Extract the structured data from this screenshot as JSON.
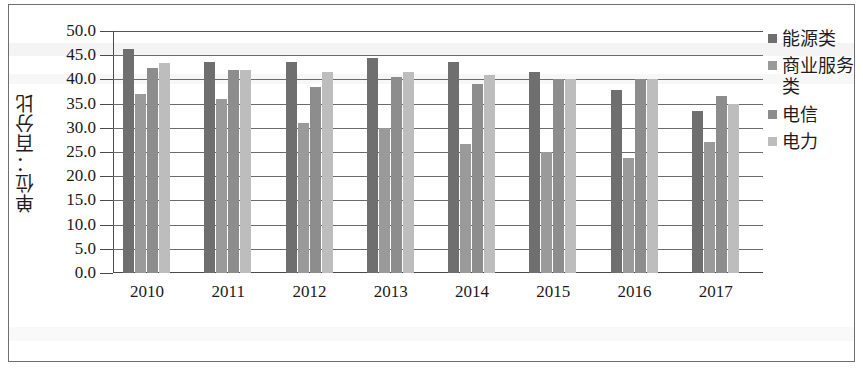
{
  "chart_data": {
    "type": "bar",
    "title": "",
    "subtitle": "",
    "xlabel": "",
    "ylabel": "单位：百分比",
    "categories": [
      "2010",
      "2011",
      "2012",
      "2013",
      "2014",
      "2015",
      "2016",
      "2017"
    ],
    "ylim": [
      0.0,
      50.0
    ],
    "ytick_step": 5.0,
    "ytick_labels": [
      "50.0",
      "45.0",
      "40.0",
      "35.0",
      "30.0",
      "25.0",
      "20.0",
      "15.0",
      "10.0",
      "5.0",
      "0.0"
    ],
    "ytick_values": [
      50.0,
      45.0,
      40.0,
      35.0,
      30.0,
      25.0,
      20.0,
      15.0,
      10.0,
      5.0,
      0.0
    ],
    "grid": true,
    "legend_position": "right",
    "series": [
      {
        "name": "能源类",
        "color": "#6f6f6f",
        "values": [
          46.2,
          43.5,
          43.5,
          44.5,
          43.5,
          41.5,
          37.8,
          33.5
        ]
      },
      {
        "name": "商业服务类",
        "color": "#9a9a9a",
        "values": [
          37.0,
          36.0,
          31.0,
          30.0,
          26.7,
          25.0,
          23.8,
          27.0
        ]
      },
      {
        "name": "电信",
        "color": "#8d8d8d",
        "values": [
          42.3,
          42.0,
          38.5,
          40.5,
          39.0,
          40.0,
          40.0,
          36.5
        ]
      },
      {
        "name": "电力",
        "color": "#bdbdbd",
        "values": [
          43.3,
          42.0,
          41.5,
          41.5,
          41.0,
          40.0,
          40.0,
          35.0
        ]
      }
    ]
  },
  "colors": {
    "frame": "#6e6e6e",
    "gridline": "#6b6b6b",
    "axis": "#4a4a4a",
    "text": "#1a1a1a",
    "background": "#ffffff"
  }
}
